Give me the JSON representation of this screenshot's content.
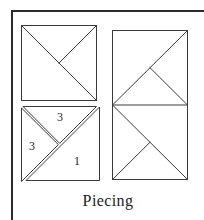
{
  "figure": {
    "name": "quilt-block-piecing-diagram",
    "caption": "Piecing",
    "background_color": "#ffffff",
    "line_color": "#3a3a3a",
    "frame_color": "#2b2b2b",
    "label_color": "#1b1b1b"
  },
  "frame": {
    "top_rule": {
      "x1": 11,
      "y1": 11,
      "x2": 204,
      "y2": 11,
      "width": 2.4
    },
    "left_rule": {
      "x1": 12,
      "y1": 11,
      "x2": 12,
      "y2": 220,
      "width": 2.4
    }
  },
  "blocks": {
    "top_left_square": {
      "name": "assembled-block-upper-left",
      "x": 21,
      "y": 25,
      "size": 76,
      "seams": [
        {
          "name": "main-diagonal",
          "from": "top-left",
          "to": "bottom-right"
        },
        {
          "name": "half-seam",
          "from": "top-right",
          "to": "center"
        }
      ]
    },
    "right_rectangle": {
      "name": "assembled-block-right-pair",
      "x": 112,
      "y": 30,
      "width": 76,
      "height": 150,
      "divider_y": 105,
      "upper_square": {
        "name": "assembled-block-upper-right",
        "seams": [
          {
            "name": "main-diagonal",
            "from": "bottom-left",
            "to": "top-right"
          },
          {
            "name": "half-seam",
            "from": "center",
            "to": "bottom-right"
          }
        ]
      },
      "lower_square": {
        "name": "assembled-block-lower-right",
        "seams": [
          {
            "name": "main-diagonal",
            "from": "top-left",
            "to": "bottom-right"
          },
          {
            "name": "half-seam",
            "from": "center",
            "to": "bottom-left"
          }
        ]
      }
    },
    "exploded_block": {
      "name": "exploded-piecing-block",
      "x": 21,
      "y": 105,
      "size": 76,
      "description": "exploded view showing three cut pieces separated by seam gaps",
      "pieces": [
        {
          "id": "piece-3-top",
          "label": "3",
          "label_x": 57,
          "label_y": 111,
          "shape": "small-triangle-upper"
        },
        {
          "id": "piece-3-left",
          "label": "3",
          "label_x": 29,
          "label_y": 140,
          "shape": "small-triangle-left"
        },
        {
          "id": "piece-1-bottom",
          "label": "1",
          "label_x": 74,
          "label_y": 155,
          "shape": "large-triangle-lower-right"
        }
      ]
    }
  },
  "labels": {
    "top_piece_number": "3",
    "left_piece_number": "3",
    "large_piece_number": "1"
  }
}
